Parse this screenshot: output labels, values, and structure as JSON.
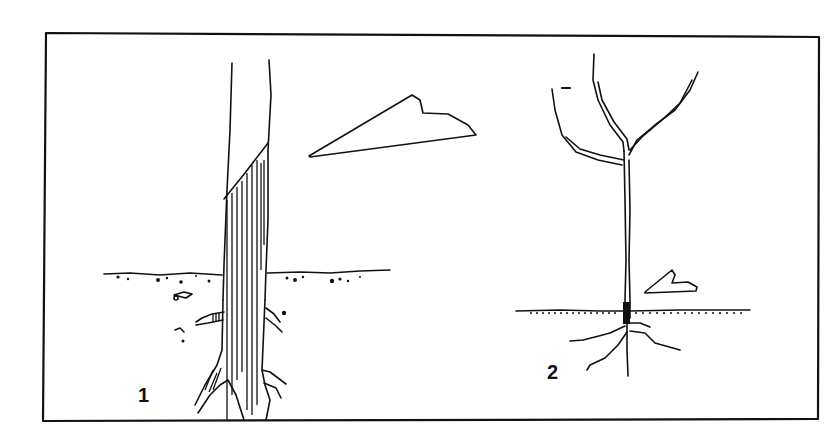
{
  "figure": {
    "type": "line-illustration",
    "panels": [
      {
        "id": "1",
        "label": "1",
        "description": "Mature tree trunk with hatched section below diagonal line extending below soil surface; arrow pointing to hatched region"
      },
      {
        "id": "2",
        "label": "2",
        "description": "Young sapling with three branches, dark marking at soil line, roots spreading below; arrow pointing to soil line"
      }
    ],
    "colors": {
      "line": "#111111",
      "background": "#ffffff"
    }
  }
}
